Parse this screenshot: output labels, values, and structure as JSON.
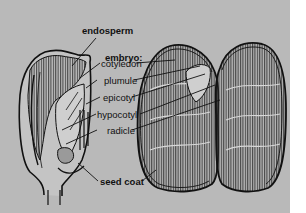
{
  "diagram": {
    "labels": {
      "endosperm": "endosperm",
      "embryo_heading": "embryo:",
      "cotyledon": "cotyledon",
      "plumule": "plumule",
      "epicotyl": "epicotyl",
      "hypocotyl": "hypocotyl",
      "radicle": "radicle",
      "seed_coat": "seed coat"
    },
    "colors": {
      "background": "#b9b9b9",
      "ink": "#111111",
      "margin": "#ffffff"
    }
  }
}
